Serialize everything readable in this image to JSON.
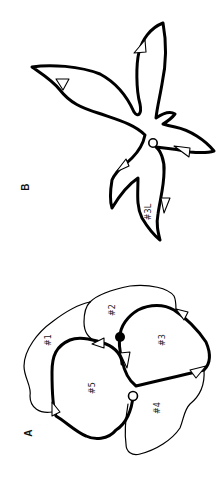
{
  "figure": {
    "orientation": "rotated-90-ccw",
    "panels": [
      {
        "id": "A",
        "label": "A",
        "regions": [
          {
            "id": "r1",
            "label": "#1"
          },
          {
            "id": "r2",
            "label": "#2"
          },
          {
            "id": "r3",
            "label": "#3"
          },
          {
            "id": "r4",
            "label": "#4"
          },
          {
            "id": "r5",
            "label": "#5"
          }
        ],
        "markers": {
          "start": "filled-circle",
          "end": "open-circle"
        }
      },
      {
        "id": "B",
        "label": "B",
        "regions": [
          {
            "id": "r3L",
            "label": "#3L"
          }
        ],
        "markers": {
          "hub": "open-circle"
        }
      }
    ],
    "colors": {
      "stroke": "#000000",
      "background": "#ffffff",
      "arrow_fill": "#ffffff"
    }
  }
}
